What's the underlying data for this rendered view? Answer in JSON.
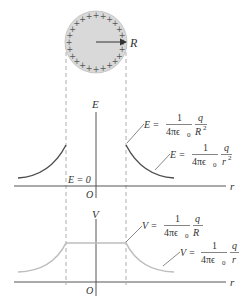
{
  "figure": {
    "sphere": {
      "charge_symbol": "+",
      "radius_label": "R",
      "fill_color": "#d9d9d9",
      "stroke_color": "#aaaaaa",
      "charge_count": 24
    },
    "e_plot": {
      "y_axis_label": "E",
      "x_axis_label": "r",
      "origin_label": "O",
      "inside_label": "E = 0",
      "curve_color": "#4d4d4d",
      "surface_annotation": {
        "lhs": "E =",
        "frac1_num": "1",
        "frac1_den": "4πϵ",
        "frac1_den_sub": "0",
        "frac2_num": "q",
        "frac2_den": "R",
        "frac2_den_sup": "2"
      },
      "outside_annotation": {
        "lhs": "E =",
        "frac1_num": "1",
        "frac1_den": "4πϵ",
        "frac1_den_sub": "0",
        "frac2_num": "q",
        "frac2_den": "r",
        "frac2_den_sup": "2"
      }
    },
    "v_plot": {
      "y_axis_label": "V",
      "x_axis_label": "r",
      "origin_label": "O",
      "curve_color": "#bdbdbd",
      "surface_annotation": {
        "lhs": "V =",
        "frac1_num": "1",
        "frac1_den": "4πϵ",
        "frac1_den_sub": "0",
        "frac2_num": "q",
        "frac2_den": "R"
      },
      "outside_annotation": {
        "lhs": "V =",
        "frac1_num": "1",
        "frac1_den": "4πϵ",
        "frac1_den_sub": "0",
        "frac2_num": "q",
        "frac2_den": "r"
      }
    },
    "colors": {
      "axis": "#555555",
      "dashed_guide": "#999999",
      "text": "#333333"
    }
  }
}
